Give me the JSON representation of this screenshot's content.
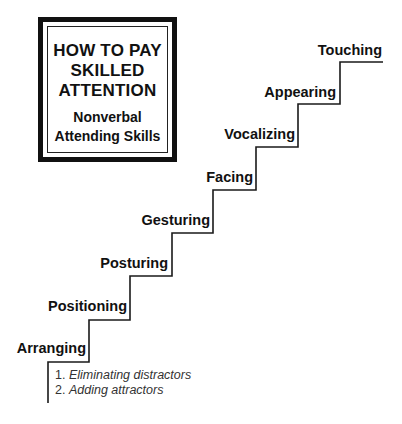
{
  "title_box": {
    "title_lines": [
      "HOW TO PAY",
      "SKILLED",
      "ATTENTION"
    ],
    "subtitle_lines": [
      "Nonverbal",
      "Attending Skills"
    ]
  },
  "steps": [
    {
      "label": "Arranging"
    },
    {
      "label": "Positioning"
    },
    {
      "label": "Posturing"
    },
    {
      "label": "Gesturing"
    },
    {
      "label": "Facing"
    },
    {
      "label": "Vocalizing"
    },
    {
      "label": "Appearing"
    },
    {
      "label": "Touching"
    }
  ],
  "arranging_subitems": [
    {
      "number": "1.",
      "text": "Eliminating distractors"
    },
    {
      "number": "2.",
      "text": "Adding attractors"
    }
  ],
  "colors": {
    "line": "#1a1a1a",
    "text": "#111111",
    "background": "#ffffff"
  }
}
